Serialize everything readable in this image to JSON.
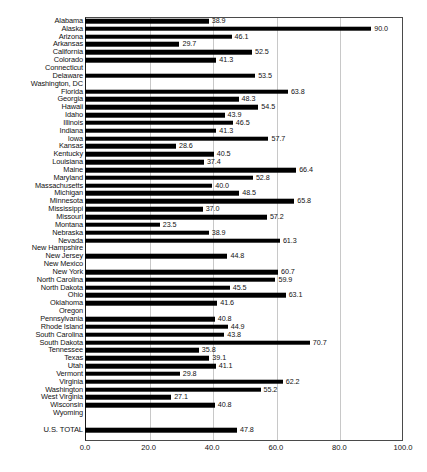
{
  "chart_data": {
    "type": "bar",
    "orientation": "horizontal",
    "title": "",
    "subtitle": "",
    "xlabel": "",
    "ylabel": "",
    "xlim": [
      0.0,
      100.0
    ],
    "xticks": [
      "0.0",
      "20.0",
      "40.0",
      "60.0",
      "80.0",
      "100.0"
    ],
    "xtick_values": [
      0,
      20,
      40,
      60,
      80,
      100
    ],
    "gridlines": [
      20,
      40,
      60,
      80
    ],
    "grid": true,
    "legend": "none",
    "bar_color": "#000000",
    "grid_color": "#c8c8c8",
    "frame_color": "#4a4a4a",
    "value_label_format": "one-decimal",
    "categories": [
      "Alabama",
      "Alaska",
      "Arizona",
      "Arkansas",
      "California",
      "Colorado",
      "Connecticut",
      "Delaware",
      "Washington, DC",
      "Florida",
      "Georgia",
      "Hawaii",
      "Idaho",
      "Illinois",
      "Indiana",
      "Iowa",
      "Kansas",
      "Kentucky",
      "Louisiana",
      "Maine",
      "Maryland",
      "Massachusetts",
      "Michigan",
      "Minnesota",
      "Mississippi",
      "Missouri",
      "Montana",
      "Nebraska",
      "Nevada",
      "New Hampshire",
      "New Jersey",
      "New Mexico",
      "New York",
      "North Carolina",
      "North Dakota",
      "Ohio",
      "Oklahoma",
      "Oregon",
      "Pennsylvania",
      "Rhode Island",
      "South Carolina",
      "South Dakota",
      "Tennessee",
      "Texas",
      "Utah",
      "Vermont",
      "Virginia",
      "Washington",
      "West Virginia",
      "Wisconsin",
      "Wyoming"
    ],
    "values": [
      38.9,
      90.0,
      46.1,
      29.7,
      52.5,
      41.3,
      null,
      53.5,
      null,
      63.8,
      48.3,
      54.5,
      43.9,
      46.5,
      41.3,
      57.7,
      28.6,
      40.5,
      37.4,
      66.4,
      52.8,
      40.0,
      48.5,
      65.8,
      37.0,
      57.2,
      23.5,
      38.9,
      61.3,
      null,
      44.8,
      null,
      60.7,
      59.9,
      45.5,
      63.1,
      41.6,
      null,
      40.8,
      44.9,
      43.8,
      70.7,
      35.8,
      39.1,
      41.1,
      29.8,
      62.2,
      55.2,
      27.1,
      40.8,
      null
    ],
    "value_labels": [
      "38.9",
      "90.0",
      "46.1",
      "29.7",
      "52.5",
      "41.3",
      "",
      "53.5",
      "",
      "63.8",
      "48.3",
      "54.5",
      "43.9",
      "46.5",
      "41.3",
      "57.7",
      "28.6",
      "40.5",
      "37.4",
      "66.4",
      "52.8",
      "40.0",
      "48.5",
      "65.8",
      "37.0",
      "57.2",
      "23.5",
      "38.9",
      "61.3",
      "",
      "44.8",
      "",
      "60.7",
      "59.9",
      "45.5",
      "63.1",
      "41.6",
      "",
      "40.8",
      "44.9",
      "43.8",
      "70.7",
      "35.8",
      "39.1",
      "41.1",
      "29.8",
      "62.2",
      "55.2",
      "27.1",
      "40.8",
      ""
    ],
    "total_row": {
      "label": "U.S. TOTAL",
      "value": 47.8,
      "value_label": "47.8"
    }
  }
}
